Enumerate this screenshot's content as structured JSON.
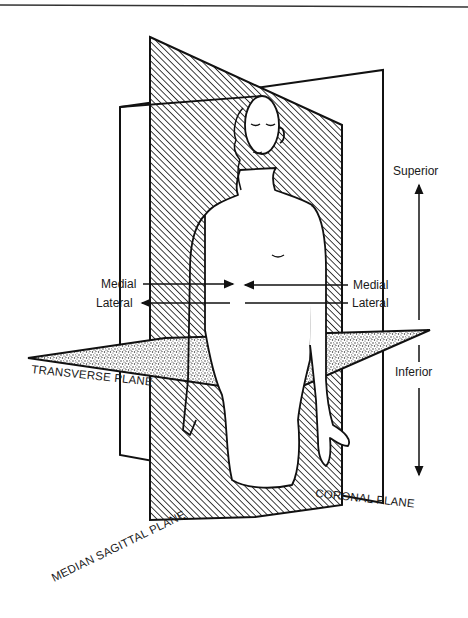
{
  "diagram": {
    "colors": {
      "ink": "#111111",
      "background": "#ffffff",
      "sagittal_fill": "hatched",
      "transverse_fill": "stippled",
      "coronal_fill": "white"
    },
    "labels": {
      "superior": "Superior",
      "inferior": "Inferior",
      "medial_left": "Medial",
      "lateral_left": "Lateral",
      "medial_right": "Medial",
      "lateral_right": "Lateral",
      "transverse_plane": "TRANSVERSE PLANE",
      "coronal_plane": "CORONAL PLANE",
      "median_sagittal_plane": "MEDIAN SAGITTAL PLANE"
    },
    "arrows": [
      {
        "name": "superior-arrow",
        "direction": "up"
      },
      {
        "name": "inferior-arrow",
        "direction": "down"
      },
      {
        "name": "medial-left-arrow",
        "direction": "right"
      },
      {
        "name": "lateral-left-arrow",
        "direction": "left"
      },
      {
        "name": "medial-right-arrow",
        "direction": "left"
      },
      {
        "name": "lateral-right-arrow",
        "direction": "right"
      }
    ]
  }
}
